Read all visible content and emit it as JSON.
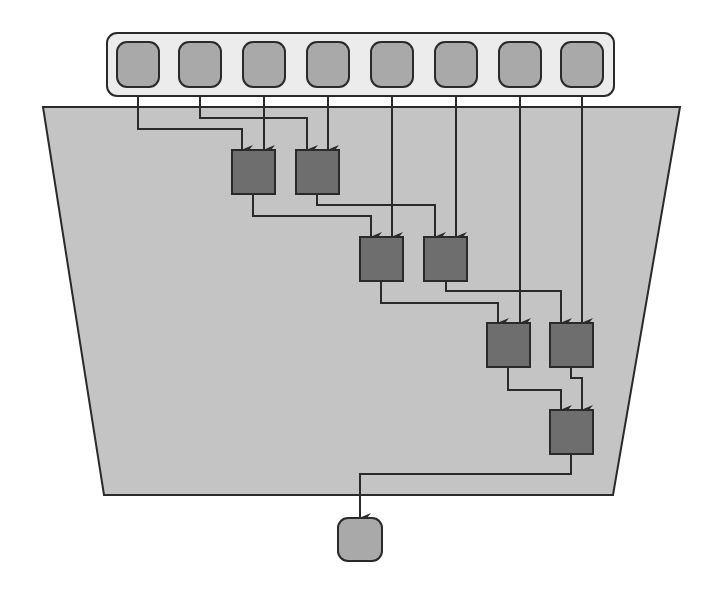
{
  "diagram": {
    "title": "",
    "type": "reduction-tree",
    "colors": {
      "background": "#ffffff",
      "region_fill": "#c4c4c4",
      "container_fill": "#ececec",
      "io_node_fill": "#a9a9a9",
      "gate_fill": "#6e6e6e",
      "stroke": "#2a2a2a"
    },
    "region": {
      "shape": "trapezoid",
      "points": [
        [
          43,
          107
        ],
        [
          680,
          107
        ],
        [
          613,
          495
        ],
        [
          104,
          495
        ]
      ]
    },
    "input_container": {
      "x": 107,
      "y": 33,
      "w": 507,
      "h": 63,
      "r": 10
    },
    "inputs": [
      {
        "id": "in1",
        "x": 117,
        "y": 42,
        "w": 42,
        "h": 45
      },
      {
        "id": "in2",
        "x": 179,
        "y": 42,
        "w": 42,
        "h": 45
      },
      {
        "id": "in3",
        "x": 243,
        "y": 42,
        "w": 42,
        "h": 45
      },
      {
        "id": "in4",
        "x": 307,
        "y": 42,
        "w": 42,
        "h": 45
      },
      {
        "id": "in5",
        "x": 371,
        "y": 42,
        "w": 42,
        "h": 45
      },
      {
        "id": "in6",
        "x": 435,
        "y": 42,
        "w": 42,
        "h": 45
      },
      {
        "id": "in7",
        "x": 499,
        "y": 42,
        "w": 42,
        "h": 45
      },
      {
        "id": "in8",
        "x": 561,
        "y": 42,
        "w": 42,
        "h": 45
      }
    ],
    "gates": [
      {
        "id": "A1",
        "x": 232,
        "y": 150,
        "w": 43,
        "h": 44
      },
      {
        "id": "A2",
        "x": 296,
        "y": 150,
        "w": 43,
        "h": 44
      },
      {
        "id": "B1",
        "x": 360,
        "y": 237,
        "w": 43,
        "h": 44
      },
      {
        "id": "B2",
        "x": 424,
        "y": 237,
        "w": 43,
        "h": 44
      },
      {
        "id": "C1",
        "x": 487,
        "y": 323,
        "w": 43,
        "h": 44
      },
      {
        "id": "C2",
        "x": 550,
        "y": 323,
        "w": 43,
        "h": 44
      },
      {
        "id": "D",
        "x": 550,
        "y": 410,
        "w": 43,
        "h": 44
      }
    ],
    "output": {
      "id": "out",
      "x": 338,
      "y": 518,
      "w": 44,
      "h": 43
    },
    "edges": [
      {
        "from": "in1",
        "to": "A1",
        "path": [
          [
            138,
            96
          ],
          [
            138,
            129
          ],
          [
            242,
            129
          ],
          [
            242,
            150
          ]
        ]
      },
      {
        "from": "in2",
        "to": "A2",
        "path": [
          [
            200,
            96
          ],
          [
            200,
            118
          ],
          [
            307,
            118
          ],
          [
            307,
            150
          ]
        ]
      },
      {
        "from": "in3",
        "to": "A1",
        "path": [
          [
            264,
            96
          ],
          [
            264,
            150
          ]
        ]
      },
      {
        "from": "in4",
        "to": "A2",
        "path": [
          [
            328,
            96
          ],
          [
            328,
            150
          ]
        ]
      },
      {
        "from": "A1",
        "to": "B1",
        "path": [
          [
            253,
            194
          ],
          [
            253,
            216
          ],
          [
            371,
            216
          ],
          [
            371,
            237
          ]
        ]
      },
      {
        "from": "A2",
        "to": "B2",
        "path": [
          [
            317,
            194
          ],
          [
            317,
            205
          ],
          [
            435,
            205
          ],
          [
            435,
            237
          ]
        ]
      },
      {
        "from": "in5",
        "to": "B1",
        "path": [
          [
            392,
            96
          ],
          [
            392,
            237
          ]
        ]
      },
      {
        "from": "in6",
        "to": "B2",
        "path": [
          [
            456,
            96
          ],
          [
            456,
            237
          ]
        ]
      },
      {
        "from": "B1",
        "to": "C1",
        "path": [
          [
            381,
            281
          ],
          [
            381,
            303
          ],
          [
            498,
            303
          ],
          [
            498,
            323
          ]
        ]
      },
      {
        "from": "B2",
        "to": "C2",
        "path": [
          [
            446,
            281
          ],
          [
            446,
            291
          ],
          [
            561,
            291
          ],
          [
            561,
            323
          ]
        ]
      },
      {
        "from": "in7",
        "to": "C1",
        "path": [
          [
            520,
            96
          ],
          [
            520,
            323
          ]
        ]
      },
      {
        "from": "in8",
        "to": "C2",
        "path": [
          [
            582,
            96
          ],
          [
            582,
            323
          ]
        ]
      },
      {
        "from": "C1",
        "to": "D",
        "path": [
          [
            508,
            367
          ],
          [
            508,
            390
          ],
          [
            561,
            390
          ],
          [
            561,
            410
          ]
        ]
      },
      {
        "from": "C2",
        "to": "D",
        "path": [
          [
            571,
            367
          ],
          [
            571,
            378
          ],
          [
            582,
            378
          ],
          [
            582,
            410
          ]
        ]
      },
      {
        "from": "D",
        "to": "out",
        "path": [
          [
            571,
            454
          ],
          [
            571,
            474
          ],
          [
            360,
            474
          ],
          [
            360,
            518
          ]
        ]
      }
    ]
  }
}
